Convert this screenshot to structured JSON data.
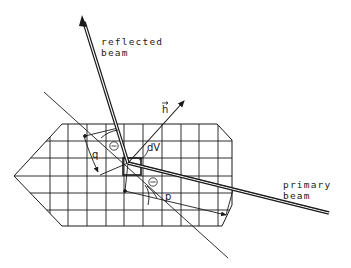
{
  "figure": {
    "type": "diffraction-geometry-diagram",
    "labels": {
      "reflected_beam_line1": "reflected",
      "reflected_beam_line2": "beam",
      "primary_beam_line1": "primary",
      "primary_beam_line2": "beam",
      "scattering_vector": "h",
      "volume_element": "dV",
      "angle_upper": "Θ",
      "angle_lower": "Θ",
      "path_q": "q",
      "path_p": "p"
    },
    "colors": {
      "ink": "#1a1a1a",
      "background": "#ffffff"
    },
    "elements": [
      "crystal-outline",
      "crystal-grid",
      "primary-beam",
      "reflected-beam",
      "scattering-vector-h",
      "lattice-plane-line",
      "volume-element-dV",
      "path-q",
      "path-p",
      "angle-arcs"
    ]
  }
}
